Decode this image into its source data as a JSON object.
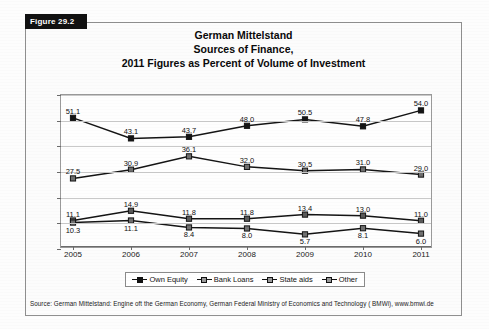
{
  "figure": {
    "badge": "Figure 29.2"
  },
  "title": {
    "line1": "German Mittelstand",
    "line2": "Sources of Finance,",
    "line3": "2011 Figures as Percent of Volume of Investment"
  },
  "source": {
    "text": "Source: German Mittelstand: Engine oft the German Economy, German Federal Ministry of Economics and Technology ( BMWi), www.bmwi.de"
  },
  "legend": {
    "items": [
      {
        "label": "Own Equity",
        "color": "#1a1a1a",
        "fill": "solid"
      },
      {
        "label": "Bank Loans",
        "color": "#1a1a1a",
        "fill": "hollow"
      },
      {
        "label": "State aids",
        "color": "#1a1a1a",
        "fill": "hollow"
      },
      {
        "label": "Other",
        "color": "#1a1a1a",
        "fill": "hollow"
      }
    ]
  },
  "chart_data": {
    "type": "line",
    "title": "German Mittelstand Sources of Finance, 2011 Figures as Percent of Volume of Investment",
    "xlabel": "",
    "ylabel": "",
    "categories": [
      "2005",
      "2006",
      "2007",
      "2008",
      "2009",
      "2010",
      "2011"
    ],
    "yticks": [
      0,
      10,
      20,
      30,
      40,
      50,
      60
    ],
    "ylim": [
      0,
      60
    ],
    "grid": true,
    "legend_position": "bottom",
    "series": [
      {
        "name": "Own Equity",
        "values": [
          51.1,
          43.1,
          43.7,
          48.0,
          50.5,
          47.8,
          54.0
        ],
        "marker": "square-filled",
        "color": "#151515"
      },
      {
        "name": "Bank Loans",
        "values": [
          27.5,
          30.9,
          36.1,
          32.0,
          30.5,
          31.0,
          29.0
        ],
        "marker": "square-gray",
        "color": "#6e6e6e"
      },
      {
        "name": "State aids",
        "values": [
          11.1,
          14.9,
          11.8,
          11.8,
          13.4,
          13.0,
          11.0
        ],
        "marker": "square-gray",
        "color": "#5a5a5a"
      },
      {
        "name": "Other",
        "values": [
          10.3,
          11.1,
          8.4,
          8.0,
          5.7,
          8.1,
          6.0
        ],
        "marker": "square-gray",
        "color": "#707070"
      }
    ]
  }
}
